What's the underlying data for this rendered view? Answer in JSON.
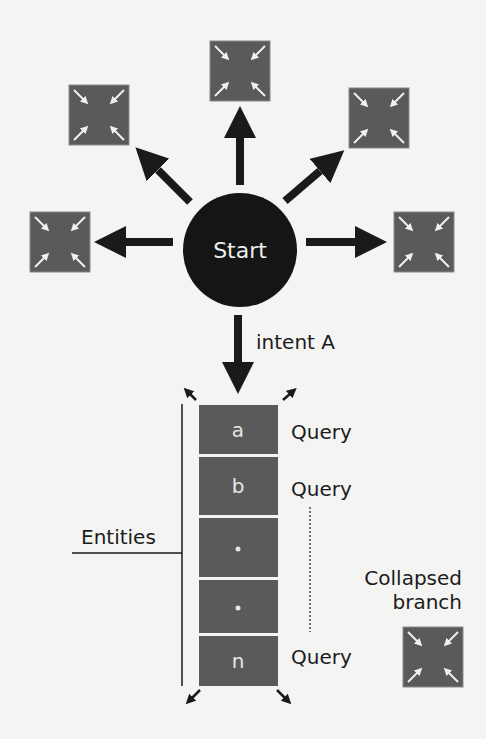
{
  "diagram": {
    "start_node": {
      "label": "Start",
      "color": "#151515"
    },
    "branch_nodes": [
      {
        "id": "top",
        "icon": "collapse-arrows-icon"
      },
      {
        "id": "upper-left",
        "icon": "collapse-arrows-icon"
      },
      {
        "id": "upper-right",
        "icon": "collapse-arrows-icon"
      },
      {
        "id": "left",
        "icon": "collapse-arrows-icon"
      },
      {
        "id": "right",
        "icon": "collapse-arrows-icon"
      }
    ],
    "intent_label": "intent A",
    "entities_label": "Entities",
    "entity_cells": [
      {
        "label": "a",
        "query": "Query"
      },
      {
        "label": "b",
        "query": "Query"
      },
      {
        "label": "•",
        "query": ""
      },
      {
        "label": "•",
        "query": ""
      },
      {
        "label": "n",
        "query": "Query"
      }
    ],
    "collapsed_branch": {
      "line1": "Collapsed",
      "line2": "branch",
      "icon": "collapse-arrows-icon"
    },
    "colors": {
      "node_fill": "#5a5a5a",
      "arrow": "#1a1a1a",
      "icon_arrow": "#f0f0f0",
      "background": "#f4f4f2"
    }
  }
}
